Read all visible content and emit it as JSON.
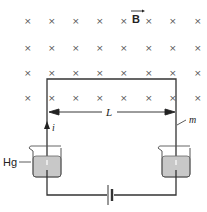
{
  "field": {
    "symbol": "×",
    "label": "B",
    "vector_arrow": true,
    "columns_x": [
      27,
      51,
      75,
      99,
      123,
      148,
      172,
      197
    ],
    "rows_y": [
      21,
      48,
      73,
      98
    ]
  },
  "labels": {
    "length": "L",
    "current": "i",
    "mercury": "Hg",
    "mass": "m"
  },
  "colors": {
    "wire": "#333333",
    "mercury_fill": "#c8c8c8",
    "beaker_outline": "#555555",
    "cross": "#555555"
  }
}
